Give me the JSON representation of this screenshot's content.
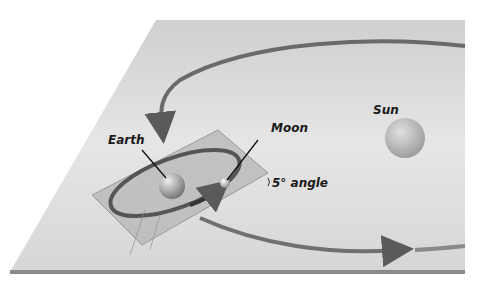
{
  "diagram": {
    "labels": {
      "sun": "Sun",
      "earth": "Earth",
      "moon": "Moon",
      "angle": "5° angle"
    },
    "colors": {
      "plane": "#d9d9d9",
      "orbit": "#6e6e6e",
      "tilted_plane": "#b8b8b8",
      "sun": "#c4c4c4",
      "earth": "#a8a8a8",
      "moon": "#d0d0d0"
    }
  }
}
